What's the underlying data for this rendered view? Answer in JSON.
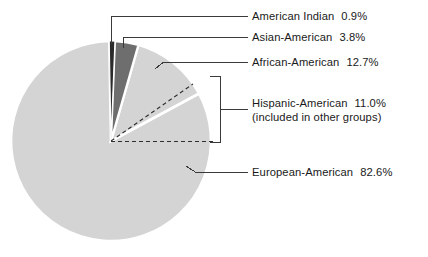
{
  "chart_data": {
    "type": "pie",
    "title": "",
    "xlabel": "",
    "ylabel": "",
    "legend_position": "right-callouts",
    "grid": false,
    "categories": [
      "American Indian",
      "Asian-American",
      "African-American",
      "European-American"
    ],
    "values": [
      0.9,
      3.8,
      12.7,
      82.6
    ],
    "value_labels": [
      "0.9%",
      "3.8%",
      "12.7%",
      "82.6%"
    ],
    "slice_colors": [
      "#2b2b2b",
      "#6e6e6e",
      "#d4d4d4",
      "#d4d4d4"
    ],
    "start_angle_deg": -1,
    "annotations": [
      {
        "name": "Hispanic-American",
        "value": 11.0,
        "value_label": "11.0%",
        "note": "(included in other groups)",
        "style": "dashed-overlay-bracket"
      }
    ]
  },
  "slices": [
    {
      "id": "american-indian",
      "label": "American Indian",
      "percent": "0.9%",
      "color": "#2b2b2b",
      "value": 0.9
    },
    {
      "id": "asian-american",
      "label": "Asian-American",
      "percent": "3.8%",
      "color": "#6e6e6e",
      "value": 3.8
    },
    {
      "id": "african-american",
      "label": "African-American",
      "percent": "12.7%",
      "color": "#d4d4d4",
      "value": 12.7
    },
    {
      "id": "european-american",
      "label": "European-American",
      "percent": "82.6%",
      "color": "#d4d4d4",
      "value": 82.6
    }
  ],
  "overlay": {
    "id": "hispanic-american",
    "label": "Hispanic-American",
    "percent": "11.0%",
    "note": "(included in other groups)",
    "value": 11.0
  },
  "colors": {
    "light_gray": "#d4d4d4",
    "dark_gray": "#6e6e6e",
    "near_black": "#2b2b2b",
    "line": "#3a3a3a",
    "text": "#1a1a1a",
    "background": "#ffffff"
  }
}
